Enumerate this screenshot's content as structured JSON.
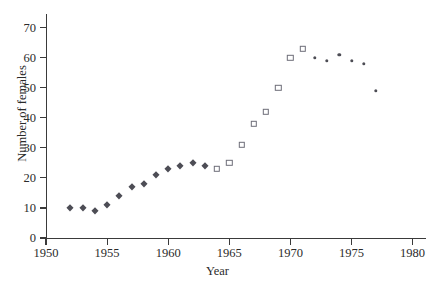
{
  "chart_data": {
    "type": "scatter",
    "title": "",
    "xlabel": "Year",
    "ylabel": "Number of females",
    "xlim": [
      1950,
      1981
    ],
    "ylim": [
      0,
      73
    ],
    "xticks": [
      1950,
      1955,
      1960,
      1965,
      1970,
      1975,
      1980
    ],
    "xtick_labels": [
      "1950",
      "1955",
      "1960",
      "1965",
      "1970",
      "1975",
      "1980"
    ],
    "yticks": [
      0,
      10,
      20,
      30,
      40,
      50,
      60,
      70
    ],
    "ytick_labels": [
      "0",
      "10",
      "20",
      "30",
      "40",
      "50",
      "60",
      "70"
    ],
    "grid": false,
    "legend": "none",
    "series": [
      {
        "name": "filled-diamond-markers",
        "marker": "diamond",
        "fill": "solid",
        "color": "#4d4d55",
        "x": [
          1952,
          1953,
          1954,
          1955,
          1956,
          1957,
          1958,
          1959,
          1960,
          1961,
          1962,
          1963
        ],
        "values": [
          10,
          10,
          9,
          11,
          14,
          17,
          18,
          21,
          23,
          24,
          25,
          24
        ]
      },
      {
        "name": "open-square-markers",
        "marker": "square",
        "fill": "open",
        "color": "#6e6e78",
        "x": [
          1964,
          1965,
          1966,
          1967,
          1968,
          1969,
          1970,
          1971
        ],
        "values": [
          23,
          25,
          31,
          38,
          42,
          50,
          60,
          63
        ]
      },
      {
        "name": "filled-dot-markers",
        "marker": "dot",
        "fill": "solid",
        "color": "#4d4d55",
        "x": [
          1972,
          1973,
          1974,
          1975,
          1976,
          1977
        ],
        "values": [
          60,
          59,
          61,
          59,
          58,
          49
        ]
      }
    ]
  },
  "axes": {
    "x_axis_label": "Year",
    "y_axis_label": "Number of females"
  },
  "colors": {
    "axis": "#3a3a3a",
    "marker_filled": "#4d4d55",
    "marker_open": "#6e6e78",
    "background": "#ffffff",
    "text": "#2b2b2b"
  }
}
